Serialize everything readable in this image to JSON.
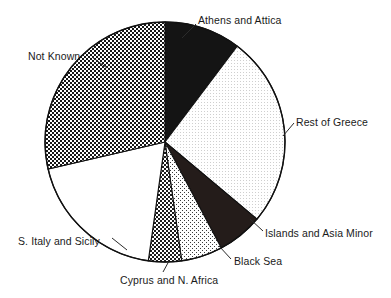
{
  "chart_data": {
    "type": "pie",
    "title": "",
    "subtitle": "",
    "xlabel": "",
    "ylabel": "",
    "legend_position": "none",
    "labels_position": "outside-callout",
    "grid": false,
    "units": "percent",
    "start_angle_deg": 0,
    "direction": "clockwise",
    "categories": [
      "Athens and Attica",
      "Rest of Greece",
      "Islands and Asia Minor",
      "Black Sea",
      "Cyprus and N. Africa",
      "S. Italy and Sicily",
      "Not Known"
    ],
    "values": [
      10.3,
      25.8,
      6.1,
      5.6,
      4.4,
      19.2,
      28.6
    ],
    "slices": [
      {
        "label": "Athens and Attica",
        "value": 10.3,
        "start_deg": 0,
        "end_deg": 37,
        "fill": "solid-black",
        "color": "#141414"
      },
      {
        "label": "Rest of Greece",
        "value": 25.8,
        "start_deg": 37,
        "end_deg": 130,
        "fill": "fine-dots-light",
        "color": "#f2f2f2"
      },
      {
        "label": "Islands and Asia Minor",
        "value": 6.1,
        "start_deg": 130,
        "end_deg": 152,
        "fill": "solid-dark",
        "color": "#241c1a"
      },
      {
        "label": "Black Sea",
        "value": 5.6,
        "start_deg": 152,
        "end_deg": 172,
        "fill": "small-checker-light",
        "color": "#e3e3e3"
      },
      {
        "label": "Cyprus and N. Africa",
        "value": 4.4,
        "start_deg": 172,
        "end_deg": 188,
        "fill": "checker-dark",
        "color": "#4a4a4a"
      },
      {
        "label": "S. Italy and Sicily",
        "value": 19.2,
        "start_deg": 188,
        "end_deg": 257,
        "fill": "white",
        "color": "#ffffff"
      },
      {
        "label": "Not Known",
        "value": 28.6,
        "start_deg": 257,
        "end_deg": 360,
        "fill": "heavy-checker",
        "color": "#5a5a5a"
      }
    ],
    "geometry": {
      "center_x": 165,
      "center_y": 142,
      "radius": 120
    },
    "outline_color": "#111111"
  },
  "labels": {
    "athens": "Athens and Attica",
    "rest_of_greece": "Rest of Greece",
    "islands": "Islands and Asia Minor",
    "black_sea": "Black Sea",
    "cyprus": "Cyprus and N. Africa",
    "s_italy": "S. Italy and Sicily",
    "not_known": "Not Known"
  }
}
